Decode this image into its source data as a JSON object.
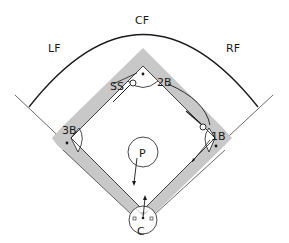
{
  "diagram": {
    "colors": {
      "line": "#1a1a1a",
      "infield_path": "#c8c8c8",
      "background": "#ffffff"
    },
    "positions": {
      "cf": "CF",
      "lf": "LF",
      "rf": "RF",
      "ss": "SS",
      "second_base": "2B",
      "third_base": "3B",
      "first_base": "1B",
      "pitcher": "P",
      "catcher": "C"
    }
  }
}
